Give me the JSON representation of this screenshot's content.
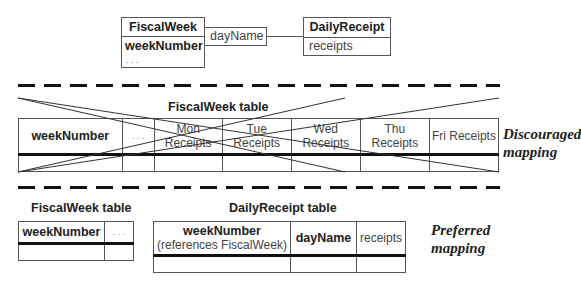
{
  "model": {
    "fiscal_week_class": {
      "name": "FiscalWeek",
      "attributes": [
        "weekNumber",
        ". . ."
      ]
    },
    "qualifier": "dayName",
    "daily_receipt_class": {
      "name": "DailyReceipt",
      "attributes": [
        "receipts"
      ]
    }
  },
  "discouraged": {
    "title": "FiscalWeek table",
    "columns": [
      "weekNumber",
      ". . .",
      "Mon Receipts",
      "Tue Receipts",
      "Wed Receipts",
      "Thu Receipts",
      "Fri Receipts"
    ],
    "label_line1": "Discouraged",
    "label_line2": "mapping"
  },
  "preferred": {
    "fiscal_week_table": {
      "title": "FiscalWeek table",
      "columns": [
        "weekNumber",
        ". . ."
      ]
    },
    "daily_receipt_table": {
      "title": "DailyReceipt table",
      "columns": [
        {
          "name": "weekNumber",
          "note": "(references FiscalWeek)"
        },
        {
          "name": "dayName"
        },
        {
          "name": "receipts"
        }
      ]
    },
    "label_line1": "Preferred",
    "label_line2": "mapping"
  }
}
